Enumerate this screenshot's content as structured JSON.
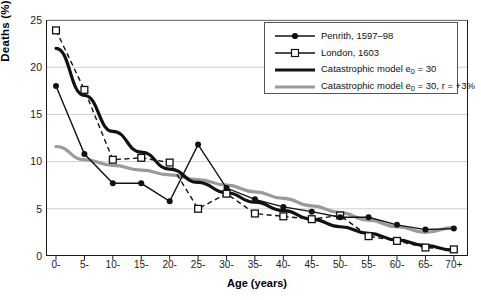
{
  "chart_data": {
    "type": "line",
    "title": "",
    "xlabel": "Age (years)",
    "ylabel": "Deaths (%)",
    "categories": [
      "0-",
      "5-",
      "10-",
      "15-",
      "20-",
      "25-",
      "30-",
      "35-",
      "40-",
      "45-",
      "50-",
      "55-",
      "60-",
      "65-",
      "70+"
    ],
    "ylim": [
      0,
      25
    ],
    "yticks": [
      0,
      5,
      10,
      15,
      20,
      25
    ],
    "grid": "horizontal",
    "legend_position": "top-right",
    "series": [
      {
        "name": "Penrith, 1597–98",
        "marker": "filled-circle",
        "line": "solid-thin",
        "color": "#111111",
        "values": [
          18.0,
          10.8,
          7.7,
          7.7,
          5.8,
          11.8,
          7.2,
          6.0,
          5.2,
          4.7,
          4.1,
          4.1,
          3.3,
          2.8,
          2.9
        ]
      },
      {
        "name": "London, 1603",
        "marker": "open-square",
        "line": "dashed",
        "color": "#111111",
        "values": [
          23.9,
          17.6,
          10.2,
          10.4,
          9.9,
          5.0,
          6.6,
          4.5,
          4.2,
          3.9,
          4.3,
          2.1,
          1.6,
          0.9,
          0.7
        ]
      },
      {
        "name": "Catastrophic model e₀ = 30",
        "marker": "none",
        "line": "solid-thick",
        "color": "#111111",
        "values": [
          22.0,
          17.0,
          13.2,
          11.0,
          9.2,
          7.8,
          6.7,
          5.7,
          4.8,
          3.9,
          3.1,
          2.4,
          1.7,
          1.1,
          0.6
        ]
      },
      {
        "name": "Catastrophic model e₀ = 30, r = +3%",
        "marker": "none",
        "line": "solid-thick",
        "color": "#9a9a9a",
        "values": [
          11.6,
          10.2,
          9.6,
          9.1,
          8.6,
          8.1,
          7.5,
          6.8,
          6.1,
          5.3,
          4.6,
          3.8,
          3.1,
          2.5,
          3.0
        ]
      }
    ],
    "legend": [
      {
        "label": "Penrith, 1597–98",
        "key": "marker-line-filled-circle"
      },
      {
        "label": "London, 1603",
        "key": "marker-line-open-square"
      },
      {
        "label": "Catastrophic model e₀ = 30",
        "key": "thick-black-line"
      },
      {
        "label": "Catastrophic model e₀ = 30, r = +3%",
        "key": "thick-gray-line"
      }
    ],
    "colors": {
      "axis": "#1a1a1a",
      "grid": "#cfcfcf",
      "black_series": "#111111",
      "gray_series": "#9a9a9a",
      "background": "#ffffff"
    }
  }
}
